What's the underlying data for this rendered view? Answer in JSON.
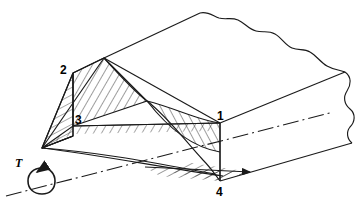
{
  "figure": {
    "kind": "technical-line-drawing",
    "background_color": "#ffffff",
    "line_color": "#1a1a1a",
    "hatch_color": "#1a1a1a"
  },
  "labels": {
    "point_1": "1",
    "point_2": "2",
    "point_3": "3",
    "point_4": "4",
    "torque": "T"
  },
  "annotations": {
    "axis_line_style": "dash-dot centerline",
    "break_line_style": "freehand wavy break",
    "torque_arrow": "circular rotation arrow about the centerline"
  },
  "geometry": {
    "point_1": [
      220,
      123
    ],
    "point_2": [
      73,
      73
    ],
    "point_3": [
      73,
      126
    ],
    "point_4": [
      220,
      181
    ],
    "left_apex": [
      42,
      148
    ],
    "top_vertex": [
      104,
      58
    ],
    "mid_cross": [
      147,
      101
    ]
  }
}
